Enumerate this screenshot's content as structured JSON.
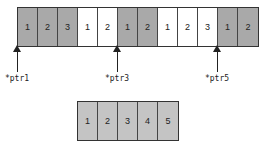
{
  "top_strip": {
    "cells": [
      {
        "label": "1",
        "shade": "gray"
      },
      {
        "label": "2",
        "shade": "gray"
      },
      {
        "label": "3",
        "shade": "gray"
      },
      {
        "label": "1",
        "shade": "white"
      },
      {
        "label": "2",
        "shade": "white"
      },
      {
        "label": "1",
        "shade": "gray"
      },
      {
        "label": "2",
        "shade": "gray"
      },
      {
        "label": "1",
        "shade": "white"
      },
      {
        "label": "2",
        "shade": "white"
      },
      {
        "label": "3",
        "shade": "white"
      },
      {
        "label": "1",
        "shade": "gray"
      },
      {
        "label": "2",
        "shade": "gray"
      }
    ]
  },
  "pointers": [
    {
      "label": "*ptr1",
      "cell_index": 0
    },
    {
      "label": "*ptr3",
      "cell_index": 5
    },
    {
      "label": "*ptr5",
      "cell_index": 10
    }
  ],
  "bottom_strip": {
    "cells": [
      {
        "label": "1",
        "shade": "light"
      },
      {
        "label": "2",
        "shade": "light"
      },
      {
        "label": "3",
        "shade": "light"
      },
      {
        "label": "4",
        "shade": "light"
      },
      {
        "label": "5",
        "shade": "light"
      }
    ]
  },
  "colors": {
    "gray_cell": "#a9a9a9",
    "white_cell": "#ffffff",
    "light_cell": "#c4c4c4",
    "border": "#333333"
  }
}
